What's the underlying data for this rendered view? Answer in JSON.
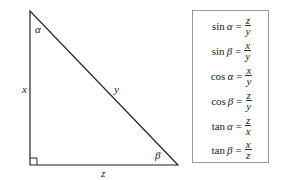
{
  "triangle": {
    "vertices": {
      "top": [
        30,
        11
      ],
      "right_angle": [
        30,
        165
      ],
      "bottom_right": [
        178,
        165
      ]
    },
    "angle_labels": {
      "alpha": "α",
      "beta": "β"
    },
    "side_labels": {
      "vertical": "x",
      "hypotenuse": "y",
      "horizontal": "z"
    },
    "right_angle_marker": true
  },
  "formulas": [
    {
      "fn": "sin",
      "angle": "α",
      "num": "z",
      "den": "y"
    },
    {
      "fn": "sin",
      "angle": "β",
      "num": "x",
      "den": "y"
    },
    {
      "fn": "cos",
      "angle": "α",
      "num": "x",
      "den": "y"
    },
    {
      "fn": "cos",
      "angle": "β",
      "num": "z",
      "den": "y"
    },
    {
      "fn": "tan",
      "angle": "α",
      "num": "z",
      "den": "x"
    },
    {
      "fn": "tan",
      "angle": "β",
      "num": "x",
      "den": "z"
    }
  ],
  "equals": "="
}
